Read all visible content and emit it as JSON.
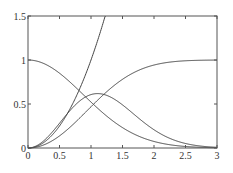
{
  "chart_data": {
    "type": "line",
    "title": "",
    "xlabel": "",
    "ylabel": "",
    "xlim": [
      0,
      3
    ],
    "ylim": [
      0,
      1.5
    ],
    "grid": false,
    "legend": null,
    "xticks": [
      0,
      0.5,
      1,
      1.5,
      2,
      2.5,
      3
    ],
    "xtick_labels": [
      "0",
      "0.5",
      "1",
      "1.5",
      "2",
      "2.5",
      "3"
    ],
    "yticks": [
      0,
      0.5,
      1,
      1.5
    ],
    "ytick_labels": [
      "0",
      "0.5",
      "1",
      "1.5"
    ],
    "x": [
      0,
      0.25,
      0.5,
      0.75,
      1.0,
      1.25,
      1.5,
      1.75,
      2.0,
      2.25,
      2.5,
      2.75,
      3.0
    ],
    "series": [
      {
        "name": "rising-steep",
        "values": [
          0,
          0.07,
          0.26,
          0.58,
          1.0,
          1.5,
          null,
          null,
          null,
          null,
          null,
          null,
          null
        ]
      },
      {
        "name": "decaying",
        "values": [
          1.0,
          0.97,
          0.87,
          0.71,
          0.52,
          0.34,
          0.19,
          0.09,
          0.04,
          0.01,
          0.0,
          0.0,
          0.0
        ]
      },
      {
        "name": "bump",
        "values": [
          0,
          0.1,
          0.3,
          0.55,
          0.75,
          0.76,
          0.6,
          0.38,
          0.2,
          0.08,
          0.02,
          0.0,
          0.0
        ]
      },
      {
        "name": "sigmoid",
        "values": [
          0,
          0.02,
          0.09,
          0.22,
          0.42,
          0.62,
          0.79,
          0.9,
          0.96,
          0.99,
          1.0,
          1.0,
          1.0
        ]
      }
    ],
    "color": "#444444"
  }
}
